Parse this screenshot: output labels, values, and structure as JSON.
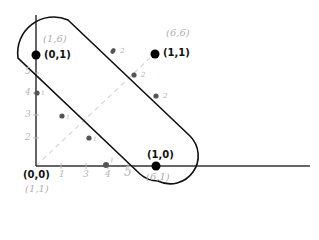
{
  "diagram": {
    "axes": {
      "y_ticks": [
        {
          "label": "5",
          "x": 26,
          "y": 70
        },
        {
          "label": "4",
          "x": 26,
          "y": 90
        },
        {
          "label": "3",
          "x": 26,
          "y": 112
        },
        {
          "label": "2",
          "x": 26,
          "y": 134
        }
      ],
      "x_ticks": [
        {
          "label": "1",
          "x": 58,
          "y": 170
        },
        {
          "label": "3",
          "x": 83,
          "y": 170
        },
        {
          "label": "4",
          "x": 104,
          "y": 170
        },
        {
          "label": "5",
          "x": 125,
          "y": 168
        }
      ]
    },
    "labeled_points": [
      {
        "bold": "(0,1)",
        "hand": "(1,6)"
      },
      {
        "bold": "(1,1)",
        "hand": "(6,6)"
      },
      {
        "bold": "(1,0)",
        "hand": "(6,1)"
      },
      {
        "bold": "(0,0)",
        "hand": "(1,1)"
      }
    ],
    "small_points": [
      {
        "label": "1",
        "x": 37,
        "y": 93
      },
      {
        "label": "1",
        "x": 62,
        "y": 116
      },
      {
        "label": "1",
        "x": 89,
        "y": 138
      },
      {
        "label": "1",
        "x": 106,
        "y": 165
      },
      {
        "label": "2",
        "x": 113,
        "y": 51
      },
      {
        "label": "2",
        "x": 134,
        "y": 75
      },
      {
        "label": "2",
        "x": 156,
        "y": 96
      }
    ],
    "colors": {
      "axis": "#333333",
      "shape": "#111111",
      "point": "#000000",
      "small_point": "#555555",
      "guide": "#d8d8d8",
      "annotation": "#b0b0b0"
    }
  }
}
